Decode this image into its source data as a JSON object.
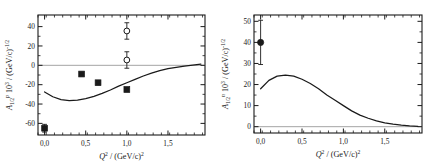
{
  "figure": {
    "background": "#ffffff",
    "ink": "#1a1a1a",
    "panel_count": 2
  },
  "panels": [
    {
      "id": "proton-panel",
      "ylabel_main": "A",
      "ylabel_sub": "1/2",
      "ylabel_sup": "p",
      "ylabel_rest": " 10",
      "ylabel_rest_sup": "3",
      "ylabel_tail": " / (GeV/c)",
      "ylabel_tail_sup": "-1/2",
      "xlabel_main": "Q",
      "xlabel_main_sup": "2",
      "xlabel_rest": " /  (GeV/c)",
      "xlabel_rest_sup": "2",
      "xticks": [
        "0,0",
        "0,5",
        "1,0",
        "1,5"
      ],
      "yticks": [
        "40",
        "20",
        "0",
        "-20",
        "-40",
        "-60"
      ]
    },
    {
      "id": "neutron-panel",
      "ylabel_main": "A",
      "ylabel_sub": "1/2",
      "ylabel_sup": "n",
      "ylabel_rest": " 10",
      "ylabel_rest_sup": "3",
      "ylabel_tail": " / (GeV/c)",
      "ylabel_tail_sup": "-1/2",
      "xlabel_main": "Q",
      "xlabel_main_sup": "2",
      "xlabel_rest": " /  (GeV/c)",
      "xlabel_rest_sup": "2",
      "xticks": [
        "0,0",
        "0,5",
        "1,0",
        "1,5"
      ],
      "yticks": [
        "50",
        "40",
        "30",
        "20",
        "10",
        "0"
      ]
    }
  ],
  "chart_data": [
    {
      "type": "scatter",
      "id": "proton-panel",
      "title": "",
      "xlabel": "Q^2 / (GeV/c)^2",
      "ylabel": "A_1/2^p 10^3 / (GeV/c)^-1/2",
      "xlim": [
        -0.08,
        1.95
      ],
      "ylim": [
        -72,
        52
      ],
      "grid": false,
      "legend": "none",
      "zero_line": true,
      "series": [
        {
          "name": "filled-squares",
          "marker": "filled-square",
          "x": [
            0.0,
            0.45,
            0.65,
            1.0
          ],
          "y": [
            -65,
            -9,
            -18,
            -25
          ],
          "yerr": [
            4,
            0,
            0,
            0
          ]
        },
        {
          "name": "open-circles",
          "marker": "open-circle",
          "x": [
            1.0,
            1.0
          ],
          "y": [
            35.5,
            5.5
          ],
          "yerr": [
            8.5,
            8.5
          ]
        },
        {
          "name": "model-curve",
          "marker": "line",
          "x": [
            0.0,
            0.1,
            0.2,
            0.3,
            0.4,
            0.5,
            0.6,
            0.7,
            0.8,
            0.9,
            1.0,
            1.1,
            1.2,
            1.3,
            1.4,
            1.5,
            1.6,
            1.7,
            1.8,
            1.9
          ],
          "y": [
            -27.5,
            -32.5,
            -35.5,
            -36.5,
            -36.0,
            -34.5,
            -32.0,
            -29.0,
            -25.5,
            -21.5,
            -18.0,
            -14.5,
            -11.0,
            -8.0,
            -5.5,
            -3.5,
            -2.0,
            -0.8,
            0.2,
            1.2
          ]
        }
      ]
    },
    {
      "type": "line",
      "id": "neutron-panel",
      "title": "",
      "xlabel": "Q^2 / (GeV/c)^2",
      "ylabel": "A_1/2^n 10^3 / (GeV/c)^-1/2",
      "xlim": [
        -0.08,
        1.95
      ],
      "ylim": [
        -3,
        53
      ],
      "grid": false,
      "legend": "none",
      "zero_line": true,
      "series": [
        {
          "name": "filled-circle",
          "marker": "filled-circle",
          "x": [
            0.0
          ],
          "y": [
            40.0
          ],
          "yerr": [
            10.5
          ]
        },
        {
          "name": "model-curve",
          "marker": "line",
          "x": [
            0.0,
            0.1,
            0.2,
            0.3,
            0.4,
            0.5,
            0.6,
            0.7,
            0.8,
            0.9,
            1.0,
            1.1,
            1.2,
            1.3,
            1.4,
            1.5,
            1.6,
            1.7,
            1.8,
            1.9
          ],
          "y": [
            18.0,
            22.0,
            24.0,
            24.5,
            24.0,
            22.5,
            20.5,
            18.0,
            15.0,
            12.5,
            10.0,
            7.5,
            5.5,
            4.0,
            2.8,
            1.8,
            1.2,
            0.7,
            0.4,
            0.2
          ]
        }
      ]
    }
  ]
}
